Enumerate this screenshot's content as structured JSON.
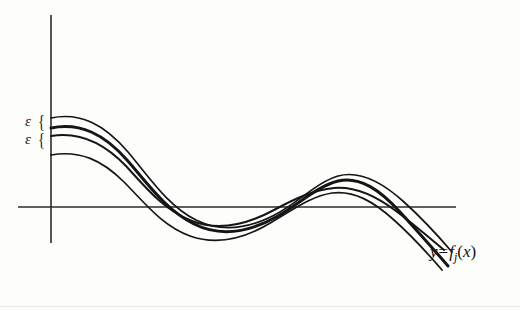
{
  "figure": {
    "background_color": "#fdfdfc",
    "ink_color": "#151515"
  },
  "axes": {
    "origin": {
      "x": 51,
      "y": 207
    },
    "x_axis": {
      "x_start": 18,
      "x_end": 456,
      "y": 207
    },
    "y_axis": {
      "x": 51,
      "y_start": 15,
      "y_end": 243
    }
  },
  "labels": {
    "epsilon_upper": {
      "symbol": "ε",
      "brace": "{"
    },
    "epsilon_lower": {
      "symbol": "ε",
      "brace": "{"
    },
    "function": {
      "y": "y",
      "equals": "=",
      "f": "f",
      "subscript": "j",
      "open_paren": "(",
      "x": "x",
      "close_paren": ")",
      "full_text": "y = f_j(x)"
    }
  },
  "chart_data": {
    "type": "line",
    "xlabel": "",
    "ylabel": "",
    "grid": false,
    "legend_position": "right-end-of-curves",
    "axis_style": "cartesian-cross",
    "annotations": [
      {
        "text": "ε",
        "kind": "brace-gap",
        "position": "left-axis-upper",
        "pixel": {
          "x": 25,
          "y": 120
        }
      },
      {
        "text": "ε",
        "kind": "brace-gap",
        "position": "left-axis-lower",
        "pixel": {
          "x": 25,
          "y": 138
        }
      },
      {
        "text": "y = f_j(x)",
        "kind": "curve-label",
        "position": "right",
        "pixel": {
          "x": 430,
          "y": 252
        }
      }
    ],
    "series": [
      {
        "name": "outer-upper",
        "stroke_width": 1.7,
        "path": "M 51 118 C 80 112 104 124 128 152 C 150 178 168 206 196 220 C 224 234 252 228 280 212 C 302 199 318 182 338 176 C 360 170 382 182 404 202 C 424 220 440 238 452 252"
      },
      {
        "name": "limit-curve-thick",
        "stroke_width": 3.0,
        "path": "M 51 128 C 80 122 104 134 127 160 C 148 184 166 210 194 224 C 222 238 250 232 278 216 C 300 203 318 186 338 181 C 360 176 380 190 400 212 C 420 234 436 252 448 266"
      },
      {
        "name": "inner-curve",
        "stroke_width": 2.0,
        "path": "M 51 136 C 80 131 104 143 126 166 C 146 188 164 210 192 221 C 220 232 248 224 274 210 C 296 198 314 190 334 188 C 356 186 376 196 396 211 C 416 226 432 240 444 250"
      },
      {
        "name": "outer-lower",
        "stroke_width": 1.7,
        "path": "M 51 155 C 80 150 102 160 124 182 C 144 202 162 226 190 236 C 218 246 246 238 272 222 C 294 209 312 196 332 193 C 354 190 374 202 394 220 C 414 238 430 256 442 270"
      }
    ]
  }
}
